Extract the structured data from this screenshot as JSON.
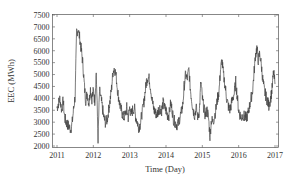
{
  "chart_data": {
    "type": "line",
    "title": "",
    "xlabel": "Time (Day)",
    "ylabel": "EEC (MWh)",
    "xlim": [
      2011,
      2017
    ],
    "ylim": [
      2000,
      7500
    ],
    "x_ticks": [
      "2011",
      "2012",
      "2013",
      "2014",
      "2015",
      "2016",
      "2017"
    ],
    "y_ticks": [
      "2000",
      "2500",
      "3000",
      "3500",
      "4000",
      "4500",
      "5000",
      "5500",
      "6000",
      "6500",
      "7000",
      "7500"
    ],
    "grid": false,
    "legend": null,
    "line_color": "#444444",
    "series": [
      {
        "name": "EEC",
        "x": [
          2011.0,
          2011.04,
          2011.08,
          2011.13,
          2011.17,
          2011.21,
          2011.25,
          2011.29,
          2011.33,
          2011.38,
          2011.42,
          2011.46,
          2011.5,
          2011.54,
          2011.58,
          2011.63,
          2011.67,
          2011.71,
          2011.75,
          2011.79,
          2011.83,
          2011.88,
          2011.92,
          2011.96,
          2012.0,
          2012.04,
          2012.08,
          2012.13,
          2012.17,
          2012.21,
          2012.25,
          2012.29,
          2012.33,
          2012.38,
          2012.42,
          2012.46,
          2012.5,
          2012.54,
          2012.58,
          2012.63,
          2012.67,
          2012.71,
          2012.75,
          2012.79,
          2012.83,
          2012.88,
          2012.92,
          2012.96,
          2013.0,
          2013.04,
          2013.08,
          2013.13,
          2013.17,
          2013.21,
          2013.25,
          2013.29,
          2013.33,
          2013.38,
          2013.42,
          2013.46,
          2013.5,
          2013.54,
          2013.58,
          2013.63,
          2013.67,
          2013.71,
          2013.75,
          2013.79,
          2013.83,
          2013.88,
          2013.92,
          2013.96,
          2014.0,
          2014.04,
          2014.08,
          2014.13,
          2014.17,
          2014.21,
          2014.25,
          2014.29,
          2014.33,
          2014.38,
          2014.42,
          2014.46,
          2014.5,
          2014.54,
          2014.58,
          2014.63,
          2014.67,
          2014.71,
          2014.75,
          2014.79,
          2014.83,
          2014.88,
          2014.92,
          2014.96,
          2015.0,
          2015.04,
          2015.08,
          2015.13,
          2015.17,
          2015.21,
          2015.25,
          2015.29,
          2015.33,
          2015.38,
          2015.42,
          2015.46,
          2015.5,
          2015.54,
          2015.58,
          2015.63,
          2015.67,
          2015.71,
          2015.75,
          2015.79,
          2015.83,
          2015.88,
          2015.92,
          2015.96,
          2016.0,
          2016.04,
          2016.08,
          2016.13,
          2016.17,
          2016.21,
          2016.25,
          2016.29,
          2016.33,
          2016.38,
          2016.42,
          2016.46,
          2016.5,
          2016.54,
          2016.58,
          2016.63,
          2016.67,
          2016.71,
          2016.75,
          2016.79,
          2016.83,
          2016.88,
          2016.92,
          2016.96,
          2017.0
        ],
        "values": [
          3600,
          3800,
          4000,
          3500,
          3900,
          3200,
          3000,
          2900,
          2800,
          2700,
          3000,
          3600,
          4100,
          6800,
          6900,
          6500,
          6000,
          5500,
          4600,
          3900,
          4200,
          3800,
          4400,
          4000,
          4300,
          3900,
          5100,
          2300,
          4300,
          4000,
          3600,
          3200,
          3000,
          3100,
          3500,
          3900,
          4400,
          5100,
          5300,
          4900,
          4300,
          3900,
          3600,
          3400,
          3200,
          3300,
          3600,
          3200,
          3600,
          3300,
          3500,
          3600,
          3200,
          3000,
          2800,
          2900,
          3300,
          3700,
          4200,
          4700,
          4900,
          4800,
          4400,
          3800,
          3500,
          3400,
          3300,
          3500,
          3600,
          3500,
          3800,
          3600,
          3500,
          3300,
          3300,
          3800,
          3500,
          3100,
          3000,
          2900,
          2900,
          3200,
          3400,
          3700,
          4500,
          5000,
          4800,
          5200,
          4400,
          3900,
          3500,
          3300,
          3600,
          3200,
          3500,
          4700,
          4000,
          3600,
          3300,
          3500,
          3200,
          2400,
          3100,
          3000,
          3200,
          3600,
          4000,
          4300,
          5200,
          5600,
          5000,
          4500,
          4000,
          3700,
          3500,
          3700,
          4000,
          4200,
          4700,
          4100,
          3500,
          3300,
          3200,
          3300,
          3200,
          3200,
          3300,
          3600,
          3900,
          4300,
          5000,
          5800,
          6100,
          5600,
          5900,
          5300,
          4700,
          4300,
          4100,
          3900,
          3700,
          4000,
          4400,
          5100,
          4600
        ]
      }
    ]
  }
}
